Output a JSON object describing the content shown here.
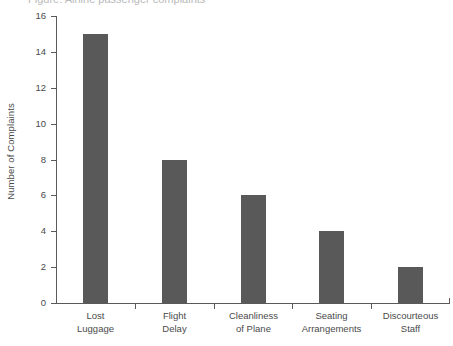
{
  "chart_data": {
    "type": "bar",
    "title": "",
    "title_remnant": "Figure: Airline passenger complaints",
    "xlabel": "",
    "ylabel": "Number of Complaints",
    "categories": [
      "Lost\nLuggage",
      "Flight\nDelay",
      "Cleanliness\nof Plane",
      "Seating\nArrangements",
      "Discourteous\nStaff"
    ],
    "category_lines": [
      [
        "Lost",
        "Luggage"
      ],
      [
        "Flight",
        "Delay"
      ],
      [
        "Cleanliness",
        "of Plane"
      ],
      [
        "Seating",
        "Arrangements"
      ],
      [
        "Discourteous",
        "Staff"
      ]
    ],
    "values": [
      15,
      8,
      6,
      4,
      2
    ],
    "ylim": [
      0,
      16
    ],
    "yticks": [
      0,
      2,
      4,
      6,
      8,
      10,
      12,
      14,
      16
    ],
    "ytick_labels": [
      "0",
      "2",
      "4",
      "6",
      "8",
      "10",
      "12",
      "14",
      "16"
    ],
    "grid": false,
    "legend": null,
    "bar_color": "#595959",
    "axis_color": "#5a5a5a",
    "text_color": "#4a4a4a",
    "background": "#ffffff"
  }
}
